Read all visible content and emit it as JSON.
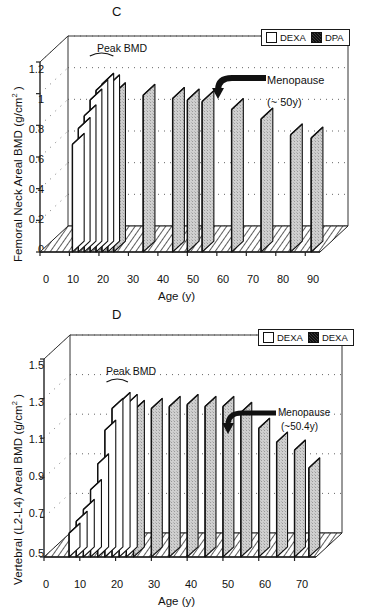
{
  "figure": {
    "panels": [
      {
        "letter": "C",
        "ylabel_main": "Femoral Neck Areal BMD (g/cm",
        "ylabel_sup": "2",
        "ylabel_tail": " )",
        "xlabel": "Age (y)",
        "peak_label": "Peak BMD",
        "anno_line1": "Menopause",
        "anno_line2": "(~ 50y)",
        "legend": [
          {
            "label": "DEXA",
            "swatch": "open"
          },
          {
            "label": "DPA",
            "swatch": "filled"
          }
        ]
      },
      {
        "letter": "D",
        "ylabel_main": "Vertebral (L2-L4) Areal BMD (g/cm",
        "ylabel_sup": "2",
        "ylabel_tail": " )",
        "xlabel": "Age (y)",
        "peak_label": "Peak BMD",
        "anno_line1": "Menopause",
        "anno_line2": "(~50.4y)",
        "legend": [
          {
            "label": "DEXA",
            "swatch": "open"
          },
          {
            "label": "DEXA",
            "swatch": "filled"
          }
        ]
      }
    ]
  },
  "chart_data": [
    {
      "type": "bar",
      "panel": "C",
      "title": "C",
      "xlabel": "Age (y)",
      "ylabel": "Femoral Neck Areal BMD (g/cm2)",
      "ylim": [
        0,
        1.2
      ],
      "yticks": [
        0,
        0.2,
        0.4,
        0.6,
        0.8,
        1,
        1.2
      ],
      "ytick_labels": [
        "0",
        "0.2",
        "0.4",
        "0.6",
        "0.8",
        "1",
        "1.2"
      ],
      "xlim": [
        0,
        95
      ],
      "xticks": [
        0,
        10,
        20,
        30,
        40,
        50,
        60,
        70,
        80,
        90
      ],
      "xtick_labels": [
        "0",
        "10",
        "20",
        "30",
        "40",
        "50",
        "60",
        "70",
        "80",
        "90"
      ],
      "grid": true,
      "legend_position": "top-right",
      "series": [
        {
          "name": "DEXA",
          "swatch": "open",
          "x": [
            11,
            13,
            15,
            17,
            19,
            21,
            23
          ],
          "values": [
            0.68,
            0.78,
            0.86,
            0.96,
            1.02,
            1.06,
            1.05
          ]
        },
        {
          "name": "DPA",
          "swatch": "filled",
          "x": [
            25,
            35,
            45,
            50,
            55,
            65,
            75,
            85,
            92
          ],
          "values": [
            1.0,
            0.99,
            0.97,
            0.96,
            0.95,
            0.9,
            0.84,
            0.74,
            0.72
          ]
        }
      ],
      "annotations": [
        {
          "text": "Peak BMD",
          "x": 20,
          "y": 1.2
        },
        {
          "text": "Menopause",
          "x": 62,
          "y": 1.1
        },
        {
          "text": "(~ 50y)",
          "x": 62,
          "y": 1.02
        }
      ]
    },
    {
      "type": "bar",
      "panel": "D",
      "title": "D",
      "xlabel": "Age (y)",
      "ylabel": "Vertebral (L2-L4) Areal BMD (g/cm2)",
      "ylim": [
        0.5,
        1.5
      ],
      "yticks": [
        0.5,
        0.7,
        0.9,
        1.1,
        1.3,
        1.5
      ],
      "ytick_labels": [
        "0.5",
        "0.7",
        "0.9",
        "1.1",
        "1.3",
        "1.5"
      ],
      "xlim": [
        0,
        76
      ],
      "xticks": [
        0,
        10,
        20,
        30,
        40,
        50,
        60,
        70
      ],
      "xtick_labels": [
        "0",
        "10",
        "20",
        "30",
        "40",
        "50",
        "60",
        "70"
      ],
      "grid": true,
      "legend_position": "top-right",
      "series": [
        {
          "name": "DEXA",
          "swatch": "open",
          "x": [
            7,
            9,
            11,
            13,
            15,
            17,
            19,
            21,
            23
          ],
          "values": [
            0.62,
            0.68,
            0.74,
            0.84,
            0.97,
            1.14,
            1.25,
            1.28,
            1.27
          ]
        },
        {
          "name": "DEXA",
          "swatch": "filled",
          "x": [
            25,
            30,
            35,
            40,
            45,
            50,
            55,
            60,
            65,
            70,
            74
          ],
          "values": [
            1.24,
            1.25,
            1.26,
            1.27,
            1.26,
            1.26,
            1.23,
            1.15,
            1.08,
            1.04,
            0.95
          ]
        }
      ],
      "annotations": [
        {
          "text": "Peak BMD",
          "x": 19,
          "y": 1.45
        },
        {
          "text": "Menopause",
          "x": 60,
          "y": 1.3
        },
        {
          "text": "(~50.4y)",
          "x": 60,
          "y": 1.24
        }
      ]
    }
  ]
}
